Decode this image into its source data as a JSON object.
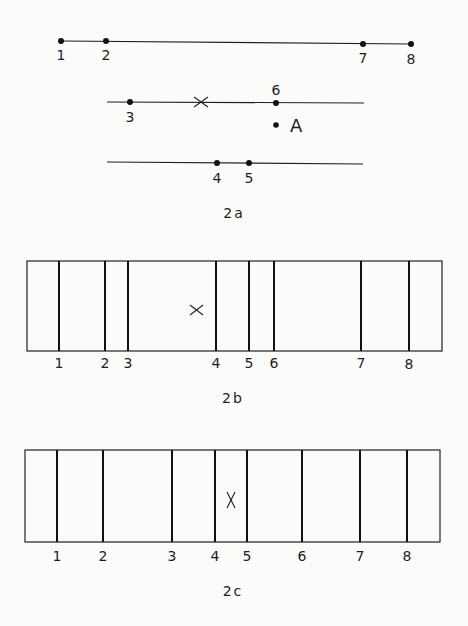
{
  "panels": {
    "a": {
      "caption": "2a",
      "lines": [
        {
          "id": "top",
          "x1": 61,
          "y1": 41,
          "x2": 411,
          "y2": 44,
          "points": [
            {
              "label": "1",
              "x": 61,
              "y": 41
            },
            {
              "label": "2",
              "x": 106,
              "y": 41
            },
            {
              "label": "7",
              "x": 363,
              "y": 44
            },
            {
              "label": "8",
              "x": 411,
              "y": 44
            }
          ]
        },
        {
          "id": "middle",
          "x1": 107,
          "y1": 102,
          "x2": 364,
          "y2": 103,
          "points": [
            {
              "label": "3",
              "x": 130,
              "y": 102
            },
            {
              "label": "6",
              "x": 276,
              "y": 103
            }
          ],
          "cross": {
            "label": "×",
            "x": 201,
            "y": 102
          }
        },
        {
          "id": "bottom",
          "x1": 107,
          "y1": 162,
          "x2": 363,
          "y2": 164,
          "points": [
            {
              "label": "4",
              "x": 217,
              "y": 163
            },
            {
              "label": "5",
              "x": 249,
              "y": 163
            }
          ]
        }
      ],
      "free_point": {
        "label": "A",
        "x": 276,
        "y": 125
      }
    },
    "b": {
      "caption": "2b",
      "box": {
        "x": 27,
        "y": 261,
        "w": 415,
        "h": 90
      },
      "dividers": [
        {
          "label": "1",
          "x": 59
        },
        {
          "label": "2",
          "x": 105
        },
        {
          "label": "3",
          "x": 128
        },
        {
          "label": "4",
          "x": 216
        },
        {
          "label": "5",
          "x": 249
        },
        {
          "label": "6",
          "x": 274
        },
        {
          "label": "7",
          "x": 361
        },
        {
          "label": "8",
          "x": 409
        }
      ],
      "marker": {
        "label": "×",
        "x": 197,
        "y": 310
      }
    },
    "c": {
      "caption": "2c",
      "box": {
        "x": 25,
        "y": 450,
        "w": 415,
        "h": 92
      },
      "dividers": [
        {
          "label": "1",
          "x": 57
        },
        {
          "label": "2",
          "x": 103
        },
        {
          "label": "3",
          "x": 172
        },
        {
          "label": "4",
          "x": 215
        },
        {
          "label": "5",
          "x": 247
        },
        {
          "label": "6",
          "x": 302
        },
        {
          "label": "7",
          "x": 360
        },
        {
          "label": "8",
          "x": 407
        }
      ],
      "marker": {
        "label": "X",
        "x": 231,
        "y": 500
      }
    }
  }
}
